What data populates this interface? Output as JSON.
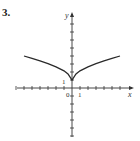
{
  "problem": {
    "number": "3."
  },
  "chart_data": {
    "type": "line",
    "title": "",
    "xlabel": "x",
    "ylabel": "y",
    "origin_label": "0",
    "tick_labels": {
      "x_unit": "1",
      "y_unit": "1"
    },
    "xlim": [
      -7,
      7
    ],
    "ylim": [
      -6,
      9
    ],
    "grid": false,
    "legend": null,
    "series": [
      {
        "name": "curve",
        "description": "cusp-shaped curve symmetric about y-axis with minimum (cusp) at (0,1)",
        "x": [
          -6,
          -5,
          -4,
          -3,
          -2,
          -1,
          -0.5,
          0,
          0.5,
          1,
          2,
          3,
          4,
          5,
          6
        ],
        "y": [
          4.0,
          3.7,
          3.4,
          3.05,
          2.65,
          2.15,
          1.75,
          1.0,
          1.75,
          2.15,
          2.65,
          3.05,
          3.4,
          3.7,
          4.0
        ]
      }
    ]
  },
  "colors": {
    "axis": "#333333",
    "curve": "#2a2a2a",
    "background": "#ffffff"
  }
}
